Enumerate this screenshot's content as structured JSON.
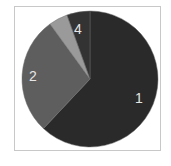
{
  "chart_data": {
    "type": "pie",
    "title": "",
    "labels": [
      "1",
      "2",
      "3",
      "4"
    ],
    "values": [
      62,
      28,
      4.5,
      5.5
    ],
    "colors": [
      "#2a2a2a",
      "#5e5e5e",
      "#9a9a9a",
      "#333333"
    ],
    "shown_labels": [
      "1",
      "2",
      "",
      "4"
    ],
    "start_angle_deg": 0,
    "direction": "clockwise",
    "legend": "none"
  }
}
